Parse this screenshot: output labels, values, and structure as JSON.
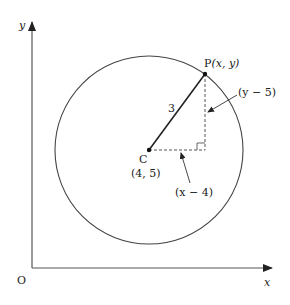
{
  "diagram": {
    "axes": {
      "y_label": "y",
      "x_label": "x",
      "origin_label": "O"
    },
    "circle": {
      "center_label": "C",
      "center_coords": "(4, 5)",
      "radius_label": "3"
    },
    "point": {
      "label_prefix": "P",
      "label_coords": "(x, y)"
    },
    "annotations": {
      "vertical_leg": "(y − 5)",
      "horizontal_leg": "(x − 4)"
    },
    "colors": {
      "stroke": "#333333",
      "text": "#222222"
    }
  }
}
